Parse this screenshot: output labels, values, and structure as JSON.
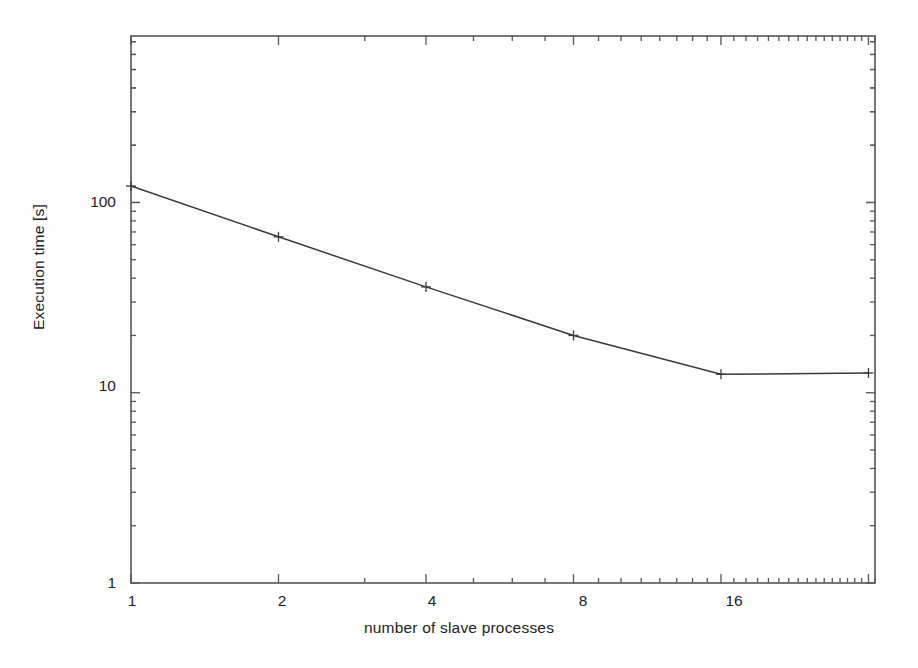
{
  "chart_data": {
    "type": "line",
    "title": "",
    "xlabel": "number of slave processes",
    "ylabel": "Execution time [s]",
    "xscale": "log2",
    "yscale": "log10",
    "xlim": [
      1,
      33
    ],
    "ylim": [
      1,
      750
    ],
    "grid": false,
    "legend": null,
    "xticks": [
      {
        "value": 1,
        "label": "1"
      },
      {
        "value": 2,
        "label": "2"
      },
      {
        "value": 4,
        "label": "4"
      },
      {
        "value": 8,
        "label": "8"
      },
      {
        "value": 16,
        "label": "16"
      }
    ],
    "yticks": [
      {
        "value": 1,
        "label": "1"
      },
      {
        "value": 10,
        "label": "10"
      },
      {
        "value": 100,
        "label": "100"
      }
    ],
    "series": [
      {
        "name": "execution time",
        "marker": "plus",
        "color": "#3a3a3a",
        "x": [
          1,
          2,
          4,
          8,
          16,
          32
        ],
        "y": [
          122,
          66,
          36,
          20,
          12.5,
          12.7
        ]
      }
    ]
  },
  "figure": {
    "background": "#ffffff",
    "axis_color": "#555555",
    "text_color": "#222222"
  }
}
